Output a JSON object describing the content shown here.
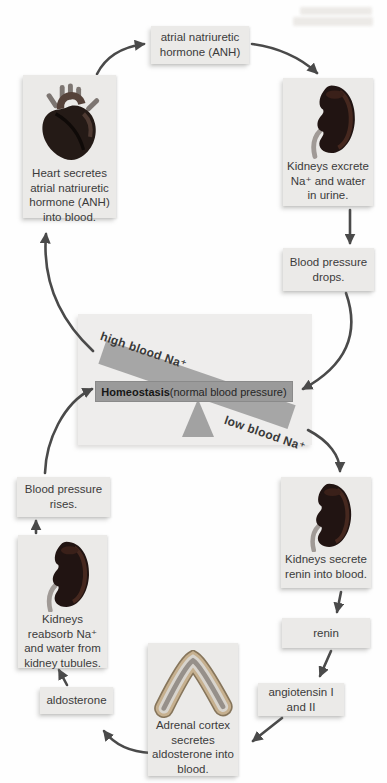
{
  "seesaw": {
    "high_label": "high blood Na⁺",
    "low_label": "low blood Na⁺",
    "bar_bold": "Homeostasis",
    "bar_rest": " (normal blood pressure)"
  },
  "nodes": {
    "anh": {
      "label": "atrial natriuretic hormone (ANH)"
    },
    "heart": {
      "caption": "Heart secretes atrial natriuretic hormone (ANH) into blood."
    },
    "kidneys_excrete": {
      "caption": "Kidneys excrete Na⁺ and water in urine."
    },
    "bp_drops": {
      "label": "Blood pressure drops."
    },
    "kidneys_renin": {
      "caption": "Kidneys secrete renin into blood."
    },
    "renin": {
      "label": "renin"
    },
    "angiotensin": {
      "label": "angiotensin I and II"
    },
    "adrenal": {
      "caption": "Adrenal cortex secretes aldosterone into blood."
    },
    "aldosterone": {
      "label": "aldosterone"
    },
    "kidneys_reabsorb": {
      "caption": "Kidneys reabsorb Na⁺ and water from kidney tubules."
    },
    "bp_rises": {
      "label": "Blood pressure rises."
    }
  },
  "colors": {
    "arrow": "#4a4a4a",
    "box_bg": "#ebeae8",
    "panel_bg": "#eeedec",
    "bar_bg": "#9a9a9a",
    "tilted_bar_bg": "#a6a6a6"
  }
}
